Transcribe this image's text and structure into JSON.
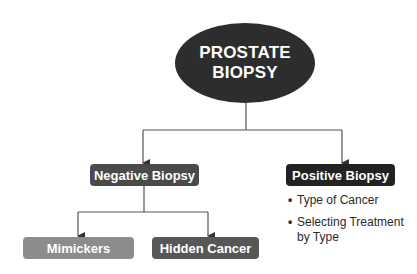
{
  "diagram": {
    "root": {
      "line1": "PROSTATE",
      "line2": "BIOPSY",
      "color": "#2d2d2d"
    },
    "negative": {
      "label": "Negative Biopsy",
      "color": "#4a4a4a",
      "children": [
        {
          "label": "Mimickers",
          "color": "#8c8c8c"
        },
        {
          "label": "Hidden Cancer",
          "color": "#575757"
        }
      ]
    },
    "positive": {
      "label": "Positive Biopsy",
      "color": "#222222",
      "bullets": [
        {
          "marker": "•",
          "text": "Type of Cancer"
        },
        {
          "marker": "•",
          "text": "Selecting Treatment by Type"
        }
      ]
    },
    "connector_color": "#555555"
  }
}
